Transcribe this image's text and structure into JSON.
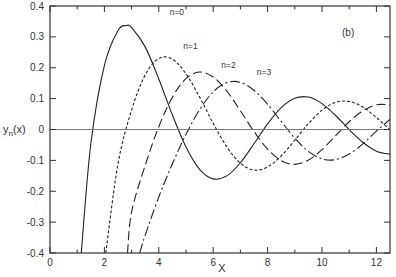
{
  "chart_data": {
    "type": "line",
    "title": "",
    "panel_label": "(b)",
    "xlabel": "X",
    "ylabel": "y_n(x)",
    "ylabel_parts": {
      "base": "y",
      "sub": "n",
      "arg": "(x)"
    },
    "xlim": [
      0,
      12.5
    ],
    "ylim": [
      -0.4,
      0.4
    ],
    "xticks_major": [
      0,
      2,
      4,
      6,
      8,
      10,
      12
    ],
    "xticks_minor": [
      1,
      3,
      5,
      7,
      9,
      11
    ],
    "xtick_labels": [
      "0",
      "2",
      "4",
      "6",
      "8",
      "10",
      "12"
    ],
    "yticks": [
      0.4,
      0.3,
      0.2,
      0.1,
      0,
      -0.1,
      -0.2,
      -0.3,
      -0.4
    ],
    "ytick_labels": [
      "0.4",
      "0.3",
      "0.2",
      "0.1",
      "0",
      "-0.1",
      "-0.2",
      "-0.3",
      "-0.4"
    ],
    "grid": false,
    "zero_line": true,
    "series": [
      {
        "name": "n=0",
        "label": "n=0",
        "style": "solid",
        "label_pos": [
          6.6,
          0.37
        ],
        "x": [
          1.15,
          1.5,
          2.0,
          2.5,
          2.8,
          3.0,
          3.5,
          4.0,
          4.5,
          5.0,
          5.5,
          6.0,
          6.5,
          7.0,
          7.5,
          8.0,
          8.5,
          9.0,
          9.5,
          10.0,
          10.5,
          11.0,
          11.5,
          12.0,
          12.5
        ],
        "y": [
          -0.4,
          -0.047,
          0.208,
          0.3205,
          0.3365,
          0.33,
          0.2676,
          0.1634,
          0.0468,
          -0.0567,
          -0.1289,
          -0.16,
          -0.1502,
          -0.1077,
          -0.0462,
          0.0182,
          0.0708,
          0.1012,
          0.105,
          0.0839,
          0.0453,
          -0.0004,
          -0.0413,
          -0.0703,
          -0.0798
        ]
      },
      {
        "name": "n=1",
        "label": "n=1",
        "style": "dotted-dash",
        "label_pos": [
          7.1,
          0.26
        ],
        "x": [
          2.05,
          2.5,
          3.0,
          3.5,
          4.0,
          4.5,
          5.0,
          5.5,
          6.0,
          6.5,
          7.0,
          7.5,
          8.0,
          8.5,
          9.0,
          9.5,
          10.0,
          10.5,
          11.0,
          11.5,
          12.0,
          12.5
        ],
        "y": [
          -0.4,
          -0.111,
          0.063,
          0.1767,
          0.23,
          0.2276,
          0.1805,
          0.1049,
          0.0199,
          -0.0562,
          -0.1093,
          -0.1313,
          -0.1214,
          -0.0856,
          -0.0346,
          0.0189,
          0.0628,
          0.0881,
          0.0909,
          0.0729,
          0.0388,
          -0.0011
        ]
      },
      {
        "name": "n=2",
        "label": "n=2",
        "style": "long-dash",
        "label_pos": [
          8.5,
          0.2
        ],
        "x": [
          2.85,
          3.0,
          3.5,
          4.0,
          4.5,
          5.0,
          5.5,
          6.0,
          6.5,
          7.0,
          7.5,
          8.0,
          8.5,
          9.0,
          9.5,
          10.0,
          10.5,
          11.0,
          11.5,
          12.0,
          12.5
        ],
        "y": [
          -0.4,
          -0.267,
          -0.116,
          0.0091,
          0.1049,
          0.165,
          0.186,
          0.17,
          0.1243,
          0.0609,
          -0.0063,
          -0.0637,
          -0.101,
          -0.1128,
          -0.099,
          -0.0651,
          -0.0201,
          0.0252,
          0.0604,
          0.0801,
          0.0796
        ]
      },
      {
        "name": "n=3",
        "label": "n=3",
        "style": "dash-dot",
        "label_pos": [
          9.8,
          0.175
        ],
        "x": [
          3.3,
          3.5,
          4.0,
          4.5,
          5.0,
          5.5,
          6.0,
          6.5,
          7.0,
          7.5,
          8.0,
          8.5,
          9.0,
          9.5,
          10.0,
          10.5,
          11.0,
          11.5,
          12.0,
          12.5
        ],
        "y": [
          -0.4,
          -0.342,
          -0.2186,
          -0.111,
          -0.0155,
          0.0642,
          0.1218,
          0.1518,
          0.1528,
          0.1271,
          0.0816,
          0.0262,
          -0.0281,
          -0.071,
          -0.0954,
          -0.0977,
          -0.0794,
          -0.0466,
          -0.0054,
          0.0329
        ]
      }
    ]
  }
}
